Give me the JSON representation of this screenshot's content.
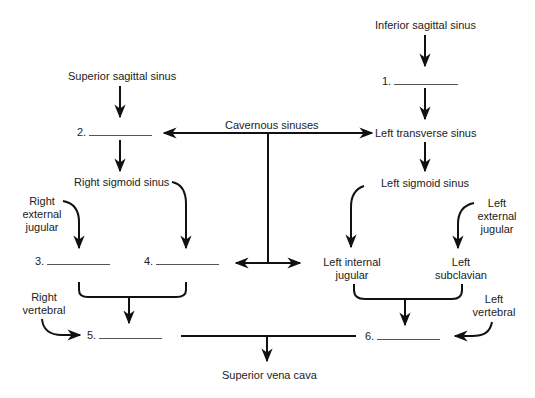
{
  "diagram": {
    "type": "venous drainage flowchart (dural sinuses to superior vena cava)",
    "nodes": {
      "inferior_sagittal": "Inferior sagittal sinus",
      "superior_sagittal": "Superior sagittal sinus",
      "cavernous": "Cavernous sinuses",
      "left_transverse": "Left transverse sinus",
      "right_sigmoid": "Right sigmoid sinus",
      "left_sigmoid": "Left sigmoid sinus",
      "right_external_jugular": [
        "Right",
        "external",
        "jugular"
      ],
      "left_external_jugular": [
        "Left",
        "external",
        "jugular"
      ],
      "left_internal_jugular": [
        "Left internal",
        "jugular"
      ],
      "left_subclavian": [
        "Left",
        "subclavian"
      ],
      "right_vertebral": [
        "Right",
        "vertebral"
      ],
      "left_vertebral": [
        "Left",
        "vertebral"
      ],
      "superior_vena_cava": "Superior vena cava"
    },
    "blanks": [
      {
        "number": "1.",
        "label": ""
      },
      {
        "number": "2.",
        "label": ""
      },
      {
        "number": "3.",
        "label": ""
      },
      {
        "number": "4.",
        "label": ""
      },
      {
        "number": "5.",
        "label": ""
      },
      {
        "number": "6.",
        "label": ""
      }
    ],
    "edges": [
      [
        "Inferior sagittal sinus",
        "1."
      ],
      [
        "1.",
        "Left transverse sinus"
      ],
      [
        "Superior sagittal sinus",
        "2."
      ],
      [
        "2.",
        "Right sigmoid sinus"
      ],
      [
        "Cavernous sinuses",
        "2."
      ],
      [
        "Cavernous sinuses",
        "Left transverse sinus"
      ],
      [
        "Cavernous sinuses",
        "4."
      ],
      [
        "Cavernous sinuses",
        "Left internal jugular"
      ],
      [
        "Left transverse sinus",
        "Left sigmoid sinus"
      ],
      [
        "Right sigmoid sinus",
        "4."
      ],
      [
        "Left sigmoid sinus",
        "Left internal jugular"
      ],
      [
        "Right external jugular",
        "3."
      ],
      [
        "Left external jugular",
        "Left subclavian"
      ],
      [
        "3.",
        "5."
      ],
      [
        "4.",
        "5."
      ],
      [
        "Right vertebral",
        "5."
      ],
      [
        "Left internal jugular",
        "6."
      ],
      [
        "Left subclavian",
        "6."
      ],
      [
        "Left vertebral",
        "6."
      ],
      [
        "5.",
        "Superior vena cava"
      ],
      [
        "6.",
        "Superior vena cava"
      ]
    ]
  }
}
